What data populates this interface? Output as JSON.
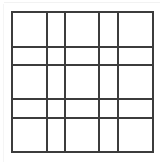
{
  "figure": {
    "type": "grid-diagram",
    "rows": 5,
    "columns": 5,
    "cell_count": 25
  },
  "canvas": {
    "width": 165,
    "height": 166,
    "background_color": "#ffffff"
  },
  "style": {
    "line_color": "#3c3c3c",
    "line_width": 2,
    "artifact_color": "#f2f2f2"
  },
  "geometry": {
    "vertical_line_x": [
      12,
      47,
      65,
      99,
      118,
      153
    ],
    "horizontal_line_y": [
      12,
      47,
      65,
      99,
      118,
      152
    ],
    "column_widths": [
      35,
      18,
      34,
      19,
      35
    ],
    "row_heights": [
      35,
      18,
      34,
      19,
      34
    ],
    "bounds": {
      "left": 12,
      "top": 12,
      "right": 153,
      "bottom": 152
    }
  },
  "labels": {
    "title": "",
    "annotations": []
  }
}
